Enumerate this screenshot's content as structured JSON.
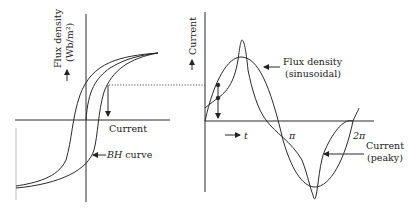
{
  "figure": {
    "left_panel": {
      "y_axis_label": "Flux density",
      "y_axis_unit": "(Wb/m²)",
      "x_axis_label": "Current",
      "curve_label_italic": "BH",
      "curve_label_rest": " curve"
    },
    "right_panel": {
      "y_axis_label": "Current",
      "time_label": "t",
      "pi_label": "π",
      "two_pi_label": "2π",
      "flux_label_line1": "Flux density",
      "flux_label_line2": "(sinusoidal)",
      "current_label_line1": "Current",
      "current_label_line2": "(peaky)"
    },
    "colors": {
      "line": "#2a2a2a",
      "background": "#ffffff"
    }
  }
}
